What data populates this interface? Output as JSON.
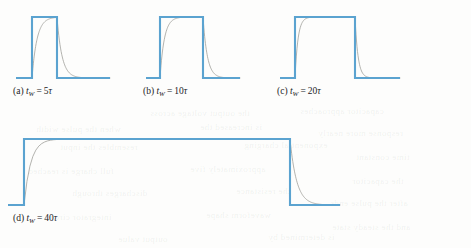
{
  "figure": {
    "pulse_color": "#5ba3d0",
    "curve_color": "#9b9b96",
    "background_color": "#fdfdfc",
    "text_color": "#23231f"
  },
  "panels": [
    {
      "id": "a",
      "tag": "(a)",
      "var": "t",
      "sub": "W",
      "eq": "=",
      "value": "5",
      "unit": "τ",
      "caption": "(a) t_W = 5τ",
      "pulse_width_tau": 5
    },
    {
      "id": "b",
      "tag": "(b)",
      "var": "t",
      "sub": "W",
      "eq": "=",
      "value": "10",
      "unit": "τ",
      "caption": "(b) t_W = 10τ",
      "pulse_width_tau": 10
    },
    {
      "id": "c",
      "tag": "(c)",
      "var": "t",
      "sub": "W",
      "eq": "=",
      "value": "20",
      "unit": "τ",
      "caption": "(c) t_W = 20τ",
      "pulse_width_tau": 20
    },
    {
      "id": "d",
      "tag": "(d)",
      "var": "t",
      "sub": "W",
      "eq": "=",
      "value": "40",
      "unit": "τ",
      "caption": "(d) t_W = 40τ",
      "pulse_width_tau": 40
    }
  ],
  "bleed_text": [
    {
      "text": "the output voltage across",
      "x": 150,
      "y": 108
    },
    {
      "text": "capacitor approaches",
      "x": 300,
      "y": 106
    },
    {
      "text": "when the pulse width",
      "x": 36,
      "y": 124
    },
    {
      "text": "is increased the",
      "x": 200,
      "y": 122
    },
    {
      "text": "response more nearly",
      "x": 318,
      "y": 128
    },
    {
      "text": "resembles the input",
      "x": 60,
      "y": 142
    },
    {
      "text": "exponential charging",
      "x": 244,
      "y": 140
    },
    {
      "text": "time constant",
      "x": 356,
      "y": 152
    },
    {
      "text": "full charge is reached",
      "x": 28,
      "y": 166
    },
    {
      "text": "approximately five",
      "x": 190,
      "y": 164
    },
    {
      "text": "the capacitor",
      "x": 352,
      "y": 176
    },
    {
      "text": "discharges through",
      "x": 72,
      "y": 188
    },
    {
      "text": "the resistance",
      "x": 236,
      "y": 186
    },
    {
      "text": "after the pulse ends",
      "x": 330,
      "y": 198
    },
    {
      "text": "integrator circuit",
      "x": 44,
      "y": 212
    },
    {
      "text": "waveform shape",
      "x": 206,
      "y": 210
    },
    {
      "text": "and the steady state",
      "x": 332,
      "y": 222
    },
    {
      "text": "output value",
      "x": 118,
      "y": 234
    },
    {
      "text": "is determined by",
      "x": 268,
      "y": 232
    }
  ],
  "chart_data": {
    "type": "line",
    "xlabel": "",
    "ylabel": "",
    "legend": [],
    "grid": false,
    "series": [
      {
        "name": "(a) input pulse t_W = 5τ",
        "panel": "a",
        "kind": "square-pulse",
        "x": [
          0,
          5,
          5,
          25,
          25,
          40
        ],
        "y": [
          0,
          0,
          1,
          1,
          0,
          0
        ]
      },
      {
        "name": "(a) capacitor voltage",
        "panel": "a",
        "kind": "exponential",
        "charge_start_tau": 5,
        "discharge_start_tau": 25,
        "peak_fraction": 0.993,
        "x_range_tau": [
          0,
          40
        ]
      },
      {
        "name": "(b) input pulse t_W = 10τ",
        "panel": "b",
        "kind": "square-pulse",
        "x": [
          0,
          5,
          5,
          35,
          35,
          50
        ],
        "y": [
          0,
          0,
          1,
          1,
          0,
          0
        ]
      },
      {
        "name": "(b) capacitor voltage",
        "panel": "b",
        "kind": "exponential",
        "charge_start_tau": 5,
        "discharge_start_tau": 35,
        "peak_fraction": 0.9999,
        "x_range_tau": [
          0,
          50
        ]
      },
      {
        "name": "(c) input pulse t_W = 20τ",
        "panel": "c",
        "kind": "square-pulse",
        "x": [
          0,
          5,
          5,
          45,
          45,
          60
        ],
        "y": [
          0,
          0,
          1,
          1,
          0,
          0
        ]
      },
      {
        "name": "(c) capacitor voltage",
        "panel": "c",
        "kind": "exponential",
        "charge_start_tau": 5,
        "discharge_start_tau": 45,
        "peak_fraction": 1.0,
        "x_range_tau": [
          0,
          60
        ]
      },
      {
        "name": "(d) input pulse t_W = 40τ",
        "panel": "d",
        "kind": "square-pulse",
        "x": [
          0,
          5,
          5,
          85,
          85,
          105
        ],
        "y": [
          0,
          0,
          1,
          1,
          0,
          0
        ]
      },
      {
        "name": "(d) capacitor voltage",
        "panel": "d",
        "kind": "exponential",
        "charge_start_tau": 5,
        "discharge_start_tau": 85,
        "peak_fraction": 1.0,
        "x_range_tau": [
          0,
          105
        ]
      }
    ]
  }
}
